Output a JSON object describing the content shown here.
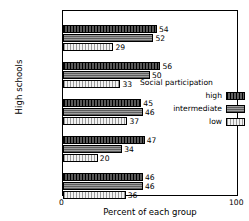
{
  "chart_data": {
    "type": "bar",
    "orientation": "horizontal",
    "title": "",
    "xlabel": "Percent of each group",
    "ylabel": "High schools",
    "xlim": [
      0,
      100
    ],
    "xticks": [
      "0",
      "100"
    ],
    "grid": false,
    "legend": {
      "title": "Social participation",
      "position": "right-middle",
      "entries": [
        "high",
        "intermediate",
        "low"
      ]
    },
    "categories": [
      "Highline",
      "Kelso",
      "Longview",
      "Dayton",
      "Stevens Co."
    ],
    "series": [
      {
        "name": "high",
        "values": [
          54,
          56,
          45,
          47,
          46
        ]
      },
      {
        "name": "intermediate",
        "values": [
          52,
          50,
          46,
          34,
          46
        ]
      },
      {
        "name": "low",
        "values": [
          29,
          33,
          37,
          20,
          36
        ]
      }
    ]
  },
  "colors": {
    "high": "#2a2a2a",
    "intermediate": "#8a8a8a",
    "low": "#e2e2e2",
    "axis": "#000000"
  }
}
